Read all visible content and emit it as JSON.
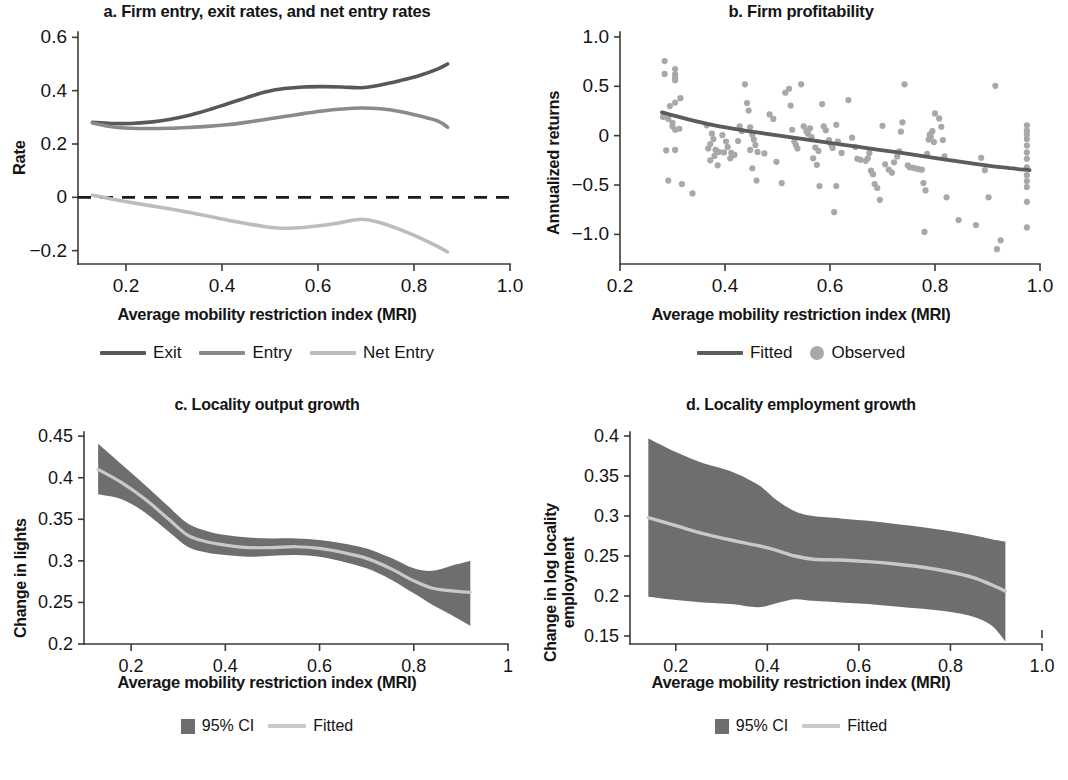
{
  "colors": {
    "exit": "#585858",
    "entry": "#8a8a8a",
    "net_entry": "#bcbcbc",
    "fitted_dark": "#5c5c5c",
    "observed": "#a8a8a8",
    "ci_band": "#6e6e6e",
    "fitted_light": "#c9c9c9",
    "axis": "#3a3a3a",
    "text": "#141414"
  },
  "panels": {
    "a": {
      "title": "a. Firm entry, exit rates, and net entry rates",
      "xlabel": "Average mobility restriction index (MRI)",
      "ylabel": "Rate",
      "xticks": [
        "0.2",
        "0.4",
        "0.6",
        "0.8",
        "1.0"
      ],
      "yticks": [
        "0.6",
        "0.4",
        "0.2",
        "0",
        "−0.2"
      ],
      "legend": [
        {
          "label": "Exit",
          "marker": "line",
          "color": "#585858"
        },
        {
          "label": "Entry",
          "marker": "line",
          "color": "#8a8a8a"
        },
        {
          "label": "Net Entry",
          "marker": "line",
          "color": "#bcbcbc"
        }
      ]
    },
    "b": {
      "title": "b. Firm profitability",
      "xlabel": "Average mobility restriction index (MRI)",
      "ylabel": "Annualized returns",
      "xticks": [
        "0.2",
        "0.4",
        "0.6",
        "0.8",
        "1.0"
      ],
      "yticks": [
        "1.0",
        "0.5",
        "0",
        "−0.5",
        "−1.0"
      ],
      "legend": [
        {
          "label": "Fitted",
          "marker": "line",
          "color": "#5c5c5c"
        },
        {
          "label": "Observed",
          "marker": "dot",
          "color": "#a8a8a8"
        }
      ]
    },
    "c": {
      "title": "c. Locality output growth",
      "xlabel": "Average mobility restriction index (MRI)",
      "ylabel": "Change in lights",
      "xticks": [
        "0.2",
        "0.4",
        "0.6",
        "0.8",
        "1"
      ],
      "yticks": [
        "0.45",
        "0.4",
        "0.35",
        "0.3",
        "0.25",
        "0.2"
      ],
      "legend": [
        {
          "label": "95% CI",
          "marker": "swatch",
          "color": "#6e6e6e"
        },
        {
          "label": "Fitted",
          "marker": "line",
          "color": "#c9c9c9"
        }
      ]
    },
    "d": {
      "title": "d. Locality employment growth",
      "xlabel": "Average mobility restriction index (MRI)",
      "ylabel_line1": "Change in log locality",
      "ylabel_line2": "employment",
      "xticks": [
        "0.2",
        "0.4",
        "0.6",
        "0.8",
        "1.0"
      ],
      "yticks": [
        "0.4",
        "0.35",
        "0.3",
        "0.25",
        "0.2",
        "0.15"
      ],
      "legend": [
        {
          "label": "95% CI",
          "marker": "swatch",
          "color": "#6e6e6e"
        },
        {
          "label": "Fitted",
          "marker": "line",
          "color": "#c9c9c9"
        }
      ]
    }
  },
  "chart_data": [
    {
      "panel": "a",
      "type": "line",
      "title": "a. Firm entry, exit rates, and net entry rates",
      "xlabel": "Average mobility restriction index (MRI)",
      "ylabel": "Rate",
      "xlim": [
        0.1,
        1.0
      ],
      "ylim": [
        -0.25,
        0.62
      ],
      "xticks": [
        0.2,
        0.4,
        0.6,
        0.8,
        1.0
      ],
      "yticks": [
        -0.2,
        0,
        0.2,
        0.4,
        0.6
      ],
      "grid": false,
      "zero_reference_line": {
        "y": 0,
        "style": "dashed",
        "color": "#1b1b1b"
      },
      "x": [
        0.13,
        0.17,
        0.21,
        0.25,
        0.29,
        0.33,
        0.37,
        0.41,
        0.45,
        0.49,
        0.53,
        0.57,
        0.61,
        0.65,
        0.69,
        0.73,
        0.77,
        0.81,
        0.85,
        0.87
      ],
      "series": [
        {
          "name": "Exit",
          "color": "#585858",
          "values": [
            0.281,
            0.277,
            0.277,
            0.282,
            0.292,
            0.307,
            0.327,
            0.35,
            0.373,
            0.395,
            0.408,
            0.414,
            0.415,
            0.414,
            0.411,
            0.421,
            0.437,
            0.456,
            0.482,
            0.5
          ]
        },
        {
          "name": "Entry",
          "color": "#8a8a8a",
          "values": [
            0.279,
            0.265,
            0.259,
            0.258,
            0.259,
            0.262,
            0.266,
            0.272,
            0.281,
            0.292,
            0.303,
            0.314,
            0.324,
            0.331,
            0.335,
            0.332,
            0.322,
            0.306,
            0.286,
            0.263
          ]
        },
        {
          "name": "Net Entry",
          "color": "#bcbcbc",
          "values": [
            0.008,
            -0.006,
            -0.019,
            -0.031,
            -0.043,
            -0.056,
            -0.07,
            -0.085,
            -0.098,
            -0.11,
            -0.116,
            -0.113,
            -0.105,
            -0.094,
            -0.082,
            -0.095,
            -0.12,
            -0.15,
            -0.185,
            -0.205
          ]
        }
      ]
    },
    {
      "panel": "b",
      "type": "scatter",
      "title": "b. Firm profitability",
      "xlabel": "Average mobility restriction index (MRI)",
      "ylabel": "Annualized returns",
      "xlim": [
        0.2,
        1.0
      ],
      "ylim": [
        -1.3,
        1.05
      ],
      "xticks": [
        0.2,
        0.4,
        0.6,
        0.8,
        1.0
      ],
      "yticks": [
        -1.0,
        -0.5,
        0,
        0.5,
        1.0
      ],
      "grid": false,
      "fitted": {
        "name": "Fitted",
        "color": "#5c5c5c",
        "x": [
          0.28,
          0.33,
          0.38,
          0.43,
          0.48,
          0.53,
          0.58,
          0.63,
          0.68,
          0.73,
          0.78,
          0.83,
          0.88,
          0.93,
          0.98
        ],
        "y": [
          0.235,
          0.165,
          0.105,
          0.058,
          0.018,
          -0.02,
          -0.058,
          -0.095,
          -0.133,
          -0.17,
          -0.21,
          -0.25,
          -0.288,
          -0.322,
          -0.35
        ]
      },
      "observed": {
        "name": "Observed",
        "color": "#a8a8a8",
        "points": [
          [
            0.285,
            0.755
          ],
          [
            0.285,
            0.625
          ],
          [
            0.305,
            0.675
          ],
          [
            0.305,
            0.62
          ],
          [
            0.305,
            0.585
          ],
          [
            0.305,
            0.56
          ],
          [
            0.295,
            0.3
          ],
          [
            0.305,
            0.335
          ],
          [
            0.315,
            0.38
          ],
          [
            0.282,
            0.19
          ],
          [
            0.292,
            0.17
          ],
          [
            0.3,
            0.13
          ],
          [
            0.3,
            0.095
          ],
          [
            0.305,
            0.06
          ],
          [
            0.313,
            0.07
          ],
          [
            0.288,
            -0.15
          ],
          [
            0.305,
            -0.145
          ],
          [
            0.292,
            -0.455
          ],
          [
            0.318,
            -0.49
          ],
          [
            0.338,
            -0.585
          ],
          [
            0.365,
            0.105
          ],
          [
            0.375,
            0.02
          ],
          [
            0.378,
            -0.035
          ],
          [
            0.372,
            -0.085
          ],
          [
            0.368,
            -0.13
          ],
          [
            0.382,
            -0.145
          ],
          [
            0.388,
            -0.165
          ],
          [
            0.38,
            -0.205
          ],
          [
            0.372,
            -0.25
          ],
          [
            0.386,
            -0.3
          ],
          [
            0.395,
            0.005
          ],
          [
            0.402,
            -0.06
          ],
          [
            0.405,
            -0.115
          ],
          [
            0.398,
            -0.17
          ],
          [
            0.412,
            -0.175
          ],
          [
            0.418,
            -0.195
          ],
          [
            0.41,
            -0.23
          ],
          [
            0.425,
            -0.055
          ],
          [
            0.428,
            0.095
          ],
          [
            0.432,
            0.045
          ],
          [
            0.438,
            0.52
          ],
          [
            0.442,
            0.33
          ],
          [
            0.445,
            0.255
          ],
          [
            0.448,
            0.085
          ],
          [
            0.452,
            0.01
          ],
          [
            0.455,
            -0.04
          ],
          [
            0.458,
            -0.095
          ],
          [
            0.448,
            -0.145
          ],
          [
            0.462,
            -0.165
          ],
          [
            0.452,
            -0.33
          ],
          [
            0.46,
            -0.455
          ],
          [
            0.475,
            -0.18
          ],
          [
            0.485,
            0.215
          ],
          [
            0.492,
            0.17
          ],
          [
            0.498,
            -0.265
          ],
          [
            0.508,
            -0.48
          ],
          [
            0.515,
            0.435
          ],
          [
            0.522,
            0.475
          ],
          [
            0.525,
            0.305
          ],
          [
            0.528,
            0.06
          ],
          [
            0.532,
            -0.06
          ],
          [
            0.535,
            -0.095
          ],
          [
            0.538,
            -0.13
          ],
          [
            0.545,
            0.52
          ],
          [
            0.55,
            0.095
          ],
          [
            0.555,
            0.045
          ],
          [
            0.558,
            0.02
          ],
          [
            0.562,
            0.075
          ],
          [
            0.565,
            -0.015
          ],
          [
            0.572,
            -0.12
          ],
          [
            0.578,
            -0.155
          ],
          [
            0.568,
            -0.23
          ],
          [
            0.575,
            -0.295
          ],
          [
            0.58,
            -0.51
          ],
          [
            0.585,
            0.32
          ],
          [
            0.588,
            0.095
          ],
          [
            0.592,
            0.055
          ],
          [
            0.598,
            -0.045
          ],
          [
            0.602,
            -0.09
          ],
          [
            0.605,
            -0.125
          ],
          [
            0.612,
            0.11
          ],
          [
            0.615,
            -0.06
          ],
          [
            0.622,
            -0.175
          ],
          [
            0.612,
            -0.51
          ],
          [
            0.608,
            -0.775
          ],
          [
            0.635,
            0.36
          ],
          [
            0.642,
            -0.02
          ],
          [
            0.648,
            -0.115
          ],
          [
            0.652,
            -0.235
          ],
          [
            0.658,
            -0.245
          ],
          [
            0.668,
            -0.255
          ],
          [
            0.672,
            -0.23
          ],
          [
            0.675,
            -0.175
          ],
          [
            0.678,
            -0.355
          ],
          [
            0.682,
            -0.39
          ],
          [
            0.685,
            -0.49
          ],
          [
            0.69,
            -0.53
          ],
          [
            0.695,
            -0.65
          ],
          [
            0.7,
            0.1
          ],
          [
            0.705,
            -0.29
          ],
          [
            0.712,
            -0.345
          ],
          [
            0.718,
            -0.375
          ],
          [
            0.722,
            -0.27
          ],
          [
            0.728,
            -0.21
          ],
          [
            0.732,
            -0.16
          ],
          [
            0.735,
            0.04
          ],
          [
            0.738,
            0.135
          ],
          [
            0.742,
            0.52
          ],
          [
            0.748,
            -0.3
          ],
          [
            0.752,
            -0.32
          ],
          [
            0.758,
            -0.325
          ],
          [
            0.762,
            -0.33
          ],
          [
            0.766,
            -0.335
          ],
          [
            0.77,
            -0.34
          ],
          [
            0.775,
            -0.345
          ],
          [
            0.778,
            -0.48
          ],
          [
            0.782,
            -0.555
          ],
          [
            0.785,
            -0.185
          ],
          [
            0.788,
            -0.04
          ],
          [
            0.79,
            0.01
          ],
          [
            0.792,
            -0.01
          ],
          [
            0.795,
            0.045
          ],
          [
            0.798,
            -0.065
          ],
          [
            0.8,
            0.225
          ],
          [
            0.808,
            0.175
          ],
          [
            0.812,
            0.09
          ],
          [
            0.815,
            -0.045
          ],
          [
            0.818,
            -0.21
          ],
          [
            0.822,
            -0.625
          ],
          [
            0.78,
            -0.975
          ],
          [
            0.845,
            -0.855
          ],
          [
            0.878,
            -0.905
          ],
          [
            0.888,
            -0.225
          ],
          [
            0.895,
            -0.35
          ],
          [
            0.902,
            -0.625
          ],
          [
            0.915,
            0.505
          ],
          [
            0.918,
            -1.15
          ],
          [
            0.925,
            -1.06
          ],
          [
            0.975,
            0.105
          ],
          [
            0.975,
            0.05
          ],
          [
            0.975,
            0.01
          ],
          [
            0.975,
            -0.035
          ],
          [
            0.975,
            -0.1
          ],
          [
            0.975,
            -0.17
          ],
          [
            0.975,
            -0.235
          ],
          [
            0.975,
            -0.32
          ],
          [
            0.975,
            -0.4
          ],
          [
            0.975,
            -0.46
          ],
          [
            0.975,
            -0.52
          ],
          [
            0.975,
            -0.67
          ],
          [
            0.975,
            -0.93
          ]
        ]
      }
    },
    {
      "panel": "c",
      "type": "area",
      "title": "c. Locality output growth",
      "xlabel": "Average mobility restriction index (MRI)",
      "ylabel": "Change in lights",
      "xlim": [
        0.1,
        1.0
      ],
      "ylim": [
        0.2,
        0.455
      ],
      "xticks": [
        0.2,
        0.4,
        0.6,
        0.8,
        1.0
      ],
      "yticks": [
        0.2,
        0.25,
        0.3,
        0.35,
        0.4,
        0.45
      ],
      "grid": false,
      "x": [
        0.13,
        0.18,
        0.23,
        0.28,
        0.32,
        0.36,
        0.4,
        0.45,
        0.5,
        0.55,
        0.6,
        0.65,
        0.7,
        0.75,
        0.8,
        0.84,
        0.88,
        0.92
      ],
      "fitted": [
        0.41,
        0.394,
        0.374,
        0.35,
        0.331,
        0.323,
        0.319,
        0.316,
        0.316,
        0.317,
        0.315,
        0.31,
        0.303,
        0.291,
        0.276,
        0.267,
        0.264,
        0.262
      ],
      "ci_lower": [
        0.38,
        0.374,
        0.358,
        0.335,
        0.317,
        0.31,
        0.307,
        0.305,
        0.306,
        0.307,
        0.305,
        0.299,
        0.291,
        0.278,
        0.261,
        0.247,
        0.235,
        0.222
      ],
      "ci_upper": [
        0.441,
        0.416,
        0.391,
        0.365,
        0.345,
        0.336,
        0.331,
        0.328,
        0.327,
        0.327,
        0.325,
        0.321,
        0.315,
        0.304,
        0.291,
        0.288,
        0.294,
        0.3
      ],
      "ci_label": "95% CI",
      "fitted_label": "Fitted"
    },
    {
      "panel": "d",
      "type": "area",
      "title": "d. Locality employment growth",
      "xlabel": "Average mobility restriction index (MRI)",
      "ylabel": "Change in log locality employment",
      "xlim": [
        0.1,
        1.0
      ],
      "ylim": [
        0.14,
        0.405
      ],
      "xticks": [
        0.2,
        0.4,
        0.6,
        0.8,
        1.0
      ],
      "yticks": [
        0.15,
        0.2,
        0.25,
        0.3,
        0.35,
        0.4
      ],
      "grid": false,
      "x": [
        0.14,
        0.2,
        0.26,
        0.32,
        0.38,
        0.42,
        0.46,
        0.5,
        0.56,
        0.62,
        0.68,
        0.74,
        0.8,
        0.85,
        0.89,
        0.92
      ],
      "fitted": [
        0.298,
        0.288,
        0.278,
        0.27,
        0.263,
        0.257,
        0.25,
        0.246,
        0.245,
        0.243,
        0.24,
        0.236,
        0.23,
        0.223,
        0.214,
        0.206
      ],
      "ci_lower": [
        0.199,
        0.195,
        0.192,
        0.19,
        0.186,
        0.191,
        0.196,
        0.194,
        0.192,
        0.19,
        0.187,
        0.184,
        0.18,
        0.174,
        0.163,
        0.143
      ],
      "ci_upper": [
        0.397,
        0.38,
        0.366,
        0.356,
        0.339,
        0.32,
        0.306,
        0.3,
        0.297,
        0.294,
        0.29,
        0.286,
        0.281,
        0.276,
        0.271,
        0.268
      ],
      "ci_label": "95% CI",
      "fitted_label": "Fitted"
    }
  ]
}
